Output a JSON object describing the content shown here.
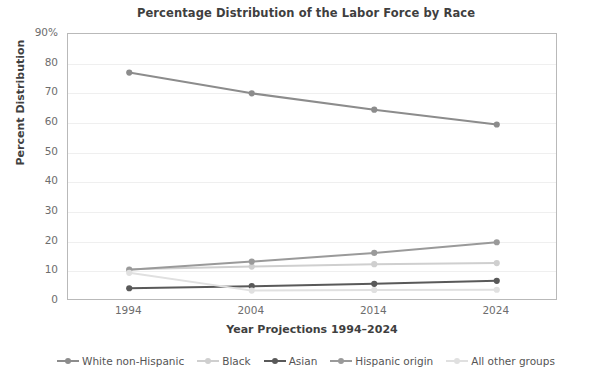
{
  "chart_data": {
    "type": "line",
    "title": "Percentage Distribution of the Labor Force by Race",
    "xlabel": "Year Projections 1994–2024",
    "ylabel": "Percent Distribution",
    "categories": [
      "1994",
      "2004",
      "2014",
      "2024"
    ],
    "x": [
      1994,
      2004,
      2014,
      2024
    ],
    "ylim": [
      0,
      90
    ],
    "yticks": [
      "0",
      "10",
      "20",
      "30",
      "40",
      "50",
      "60",
      "70",
      "80",
      "90%"
    ],
    "ytick_values": [
      0,
      10,
      20,
      30,
      40,
      50,
      60,
      70,
      80,
      90
    ],
    "grid": true,
    "legend_position": "bottom",
    "series": [
      {
        "name": "White non-Hispanic",
        "color": "#8c8c8c",
        "values": [
          77.0,
          70.0,
          64.5,
          59.5
        ]
      },
      {
        "name": "Black",
        "color": "#cfcfcf",
        "values": [
          10.7,
          11.6,
          12.4,
          12.8
        ]
      },
      {
        "name": "Asian",
        "color": "#595959",
        "values": [
          4.3,
          5.0,
          5.8,
          6.8
        ]
      },
      {
        "name": "Hispanic origin",
        "color": "#9a9a9a",
        "values": [
          10.5,
          13.3,
          16.2,
          19.8
        ]
      },
      {
        "name": "All other groups",
        "color": "#e0e0e0",
        "values": [
          9.5,
          3.5,
          3.7,
          3.8
        ]
      }
    ]
  }
}
